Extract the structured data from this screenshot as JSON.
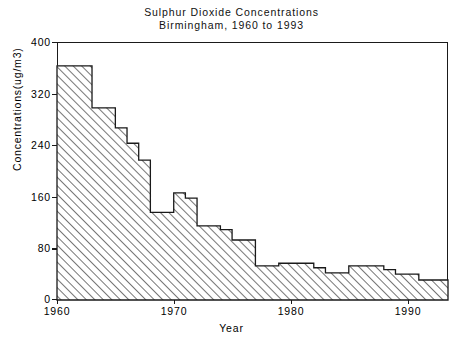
{
  "chart_data": {
    "type": "area",
    "title": "Sulphur Dioxide Concentrations",
    "subtitle": "Birmingham, 1960 to 1993",
    "xlabel": "Year",
    "ylabel": "Concentrations(ug/m3)",
    "xlim": [
      1960,
      1993.5
    ],
    "ylim": [
      0,
      400
    ],
    "grid": false,
    "legend": null,
    "style": "step (hatched fill, diagonal lines)",
    "x_ticks": [
      1960,
      1970,
      1980,
      1990
    ],
    "x_tick_labels": [
      "1960",
      "1970",
      "1980",
      "1990"
    ],
    "y_ticks": [
      0,
      80,
      160,
      240,
      320,
      400
    ],
    "y_tick_labels": [
      "0",
      "80",
      "160",
      "240",
      "320",
      "400"
    ],
    "x": [
      1960,
      1961,
      1962,
      1963,
      1964,
      1965,
      1966,
      1967,
      1968,
      1969,
      1970,
      1971,
      1972,
      1973,
      1974,
      1975,
      1976,
      1977,
      1978,
      1979,
      1980,
      1981,
      1982,
      1983,
      1984,
      1985,
      1986,
      1987,
      1988,
      1989,
      1990,
      1991,
      1992,
      1993
    ],
    "values": [
      363,
      363,
      363,
      298,
      298,
      267,
      243,
      217,
      136,
      136,
      166,
      158,
      115,
      115,
      109,
      93,
      93,
      53,
      53,
      57,
      57,
      57,
      50,
      42,
      42,
      53,
      53,
      53,
      47,
      40,
      40,
      31,
      31,
      31
    ],
    "units": "ug/m3"
  },
  "chart": {
    "title_line1": "Sulphur Dioxide Concentrations",
    "title_line2": "Birmingham, 1960 to 1993",
    "y_axis_title": "Concentrations(ug/m3)",
    "x_axis_title": "Year",
    "y_labels": [
      "400",
      "320",
      "240",
      "160",
      "80",
      "0"
    ],
    "x_labels": [
      "1960",
      "1970",
      "1980",
      "1990"
    ],
    "colors": {
      "axis": "#1a1a1a",
      "hatch": "#6f6f6f",
      "background": "#ffffff",
      "outline": "#1a1a1a"
    }
  }
}
